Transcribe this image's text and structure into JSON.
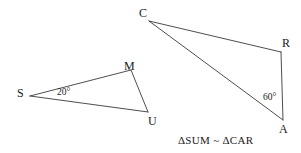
{
  "figure": {
    "width": 301,
    "height": 153,
    "background_color": "#ffffff",
    "stroke_color": "#3a3a3a",
    "text_color": "#1a1a1a"
  },
  "caption": {
    "text": "ΔSUM ~ ΔCAR"
  },
  "triangles": [
    {
      "name": "triangle-sum",
      "vertices": [
        {
          "label": "S",
          "x": 30,
          "y": 96
        },
        {
          "label": "M",
          "x": 131,
          "y": 70
        },
        {
          "label": "U",
          "x": 148,
          "y": 112
        }
      ],
      "angles": [
        {
          "at": "S",
          "text": "20°"
        }
      ]
    },
    {
      "name": "triangle-car",
      "vertices": [
        {
          "label": "C",
          "x": 149,
          "y": 21
        },
        {
          "label": "R",
          "x": 281,
          "y": 52
        },
        {
          "label": "A",
          "x": 283,
          "y": 120
        }
      ],
      "angles": [
        {
          "at": "A",
          "text": "60°"
        }
      ]
    }
  ],
  "labels": {
    "S": "S",
    "M": "M",
    "U": "U",
    "C": "C",
    "R": "R",
    "A": "A",
    "angle_S": "20°",
    "angle_A": "60°"
  }
}
